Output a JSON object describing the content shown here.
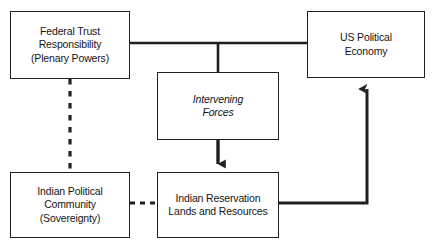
{
  "diagram": {
    "background_color": "#ffffff",
    "stroke_color": "#231f20",
    "nodes": [
      {
        "id": "federal-trust",
        "label": "Federal Trust\nResponsibility\n(Plenary Powers)",
        "style": "normal"
      },
      {
        "id": "us-political",
        "label": "US Political\nEconomy",
        "style": "normal"
      },
      {
        "id": "intervening",
        "label": "Intervening\nForces",
        "style": "italic"
      },
      {
        "id": "indian-political",
        "label": "Indian Political\nCommunity\n(Sovereignty)",
        "style": "normal"
      },
      {
        "id": "indian-reservation",
        "label": "Indian Reservation\nLands and Resources",
        "style": "normal"
      }
    ],
    "connectors": [
      {
        "id": "federal-trust-to-us-political",
        "from": "federal-trust",
        "to": "us-political",
        "line": "solid",
        "arrow": "none"
      },
      {
        "id": "federal-trust-branch-to-intervening",
        "from": "federal-trust-to-us-political",
        "to": "intervening",
        "line": "solid",
        "arrow": "none"
      },
      {
        "id": "intervening-to-indian-reservation",
        "from": "intervening",
        "to": "indian-reservation",
        "line": "solid",
        "arrow": "down"
      },
      {
        "id": "indian-reservation-to-us-political",
        "from": "indian-reservation",
        "to": "us-political",
        "line": "solid",
        "arrow": "up"
      },
      {
        "id": "federal-trust-to-indian-political",
        "from": "federal-trust",
        "to": "indian-political",
        "line": "dashed",
        "arrow": "none"
      },
      {
        "id": "indian-political-to-indian-reservation",
        "from": "indian-political",
        "to": "indian-reservation",
        "line": "dashed",
        "arrow": "none"
      }
    ]
  }
}
